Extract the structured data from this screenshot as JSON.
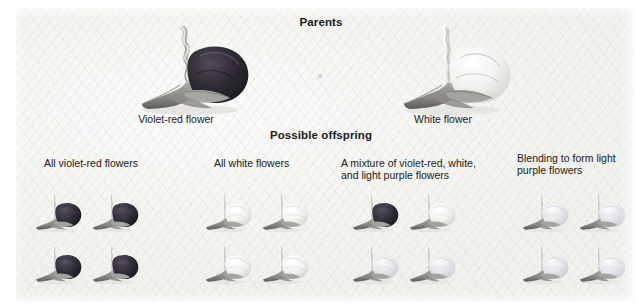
{
  "figure": {
    "background_color": "#f4f4f1",
    "page_color": "#ffffff",
    "text_color": "#1b1b1b"
  },
  "headings": {
    "parents": "Parents",
    "offspring": "Possible offspring"
  },
  "cross_symbol": "×",
  "parents": [
    {
      "id": "violet-red-parent",
      "label": "Violet-red flower",
      "petal_color": "#2e2b33",
      "variant": "violet-red"
    },
    {
      "id": "white-parent",
      "label": "White flower",
      "petal_color": "#f2f2f0",
      "variant": "white"
    }
  ],
  "offspring_groups": [
    {
      "id": "group-all-violet-red",
      "label": "All violet-red flowers",
      "flowers": [
        "violet-red",
        "violet-red",
        "violet-red",
        "violet-red"
      ]
    },
    {
      "id": "group-all-white",
      "label": "All white flowers",
      "flowers": [
        "white",
        "white",
        "white",
        "white"
      ]
    },
    {
      "id": "group-mixture",
      "label": "A mixture of violet-red, white,\nand light purple flowers",
      "flowers": [
        "violet-red",
        "white",
        "light-purple",
        "light-purple"
      ]
    },
    {
      "id": "group-blending",
      "label": "Blending to form light\npurple flowers",
      "flowers": [
        "light-purple",
        "light-purple",
        "light-purple",
        "light-purple"
      ]
    }
  ],
  "flower_colors": {
    "violet-red": "#2f2b32",
    "white": "#f4f4f2",
    "light-purple": "#e4e3e6"
  }
}
